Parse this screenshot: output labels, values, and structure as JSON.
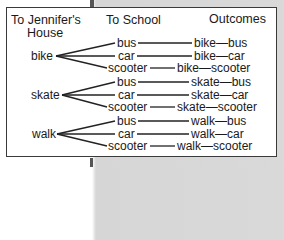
{
  "diagram": {
    "type": "tree-diagram",
    "headers": {
      "col1": "To Jennifer's",
      "col1_line2": "House",
      "col2": "To School",
      "col3": "Outcomes"
    },
    "groups": [
      {
        "root": "bike",
        "branches": [
          "bus",
          "car",
          "scooter"
        ],
        "outcomes": [
          "bike—bus",
          "bike—car",
          "bike—scooter"
        ]
      },
      {
        "root": "skate",
        "branches": [
          "bus",
          "car",
          "scooter"
        ],
        "outcomes": [
          "skate—bus",
          "skate—car",
          "skate—scooter"
        ]
      },
      {
        "root": "walk",
        "branches": [
          "bus",
          "car",
          "scooter"
        ],
        "outcomes": [
          "walk—bus",
          "walk—car",
          "walk—scooter"
        ]
      }
    ],
    "colors": {
      "border": "#3a3a3a",
      "text": "#1a1a1a",
      "page_right_bg": "#d9d9d9"
    }
  }
}
